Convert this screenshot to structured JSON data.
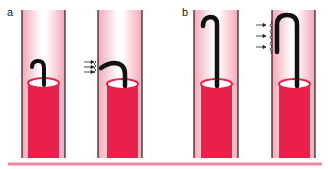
{
  "figure": {
    "panels": [
      {
        "label": "a",
        "description": "Short curved guidewire tip; arrows indicate flow pushing tip",
        "scenes": [
          "tip-hooked",
          "tip-deflected-by-flow"
        ]
      },
      {
        "label": "b",
        "description": "Long hooked guidewire; arrows indicate flow against wavy vessel wall",
        "scenes": [
          "long-hook",
          "long-hook-with-wall-contact"
        ]
      }
    ],
    "colors": {
      "catheter": "#e8204a",
      "catheter_top": "#ffffff",
      "vessel_edge": "#f2a9b8",
      "vessel_center": "#ffffff",
      "vessel_wall": "#2b1a1e",
      "guidewire": "#111111",
      "baseline": "#f08a9c"
    }
  }
}
